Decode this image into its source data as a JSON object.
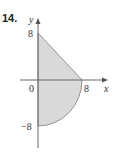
{
  "problem_number": "14.",
  "diagram": {
    "axes": {
      "x_label": "x",
      "y_label": "y"
    },
    "ticks": {
      "x_8": "8",
      "y_8": "8",
      "y_neg8": "−8",
      "origin": "0"
    },
    "region": "Shaded region bounded by line from (0,8) to (8,0) above x-axis and quarter circle of radius 8 from (8,0) to (0,−8) below x-axis",
    "colors": {
      "fill": "#d9d9d9",
      "stroke": "#777777",
      "axis": "#666666"
    }
  }
}
